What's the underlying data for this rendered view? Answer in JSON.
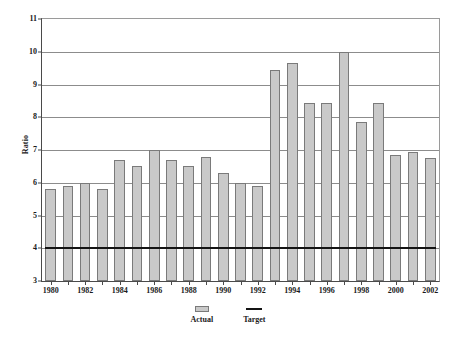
{
  "chart_data": {
    "type": "bar",
    "title": "",
    "xlabel": "",
    "ylabel": "Ratio",
    "ylim": [
      3,
      11
    ],
    "ytick_step": 1,
    "yticks": [
      "3",
      "4",
      "5",
      "6",
      "7",
      "8",
      "9",
      "10",
      "11"
    ],
    "grid": true,
    "legend_position": "bottom",
    "categories": [
      "1980",
      "1981",
      "1982",
      "1983",
      "1984",
      "1985",
      "1986",
      "1987",
      "1988",
      "1989",
      "1990",
      "1991",
      "1992",
      "1993",
      "1994",
      "1995",
      "1996",
      "1997",
      "1998",
      "1999",
      "2000",
      "2001",
      "2002"
    ],
    "xtick_labels": [
      "1980",
      "1982",
      "1984",
      "1986",
      "1988",
      "1990",
      "1992",
      "1994",
      "1996",
      "1998",
      "2000",
      "2002"
    ],
    "series": [
      {
        "name": "Actual",
        "type": "bar",
        "color": "#c9c9c9",
        "edge_color": "#7a7a7a",
        "values": [
          5.8,
          5.9,
          6.0,
          5.8,
          6.7,
          6.5,
          7.0,
          6.7,
          6.5,
          6.8,
          6.3,
          6.0,
          5.9,
          9.45,
          9.65,
          8.45,
          8.45,
          10.0,
          7.85,
          8.45,
          6.85,
          6.95,
          6.75
        ]
      },
      {
        "name": "Target",
        "type": "line",
        "color": "#141414",
        "constant_value": 4.0
      }
    ]
  },
  "legend": {
    "items": [
      {
        "label": "Actual",
        "swatch": "bar-swatch-icon"
      },
      {
        "label": "Target",
        "swatch": "line-swatch-icon"
      }
    ]
  }
}
